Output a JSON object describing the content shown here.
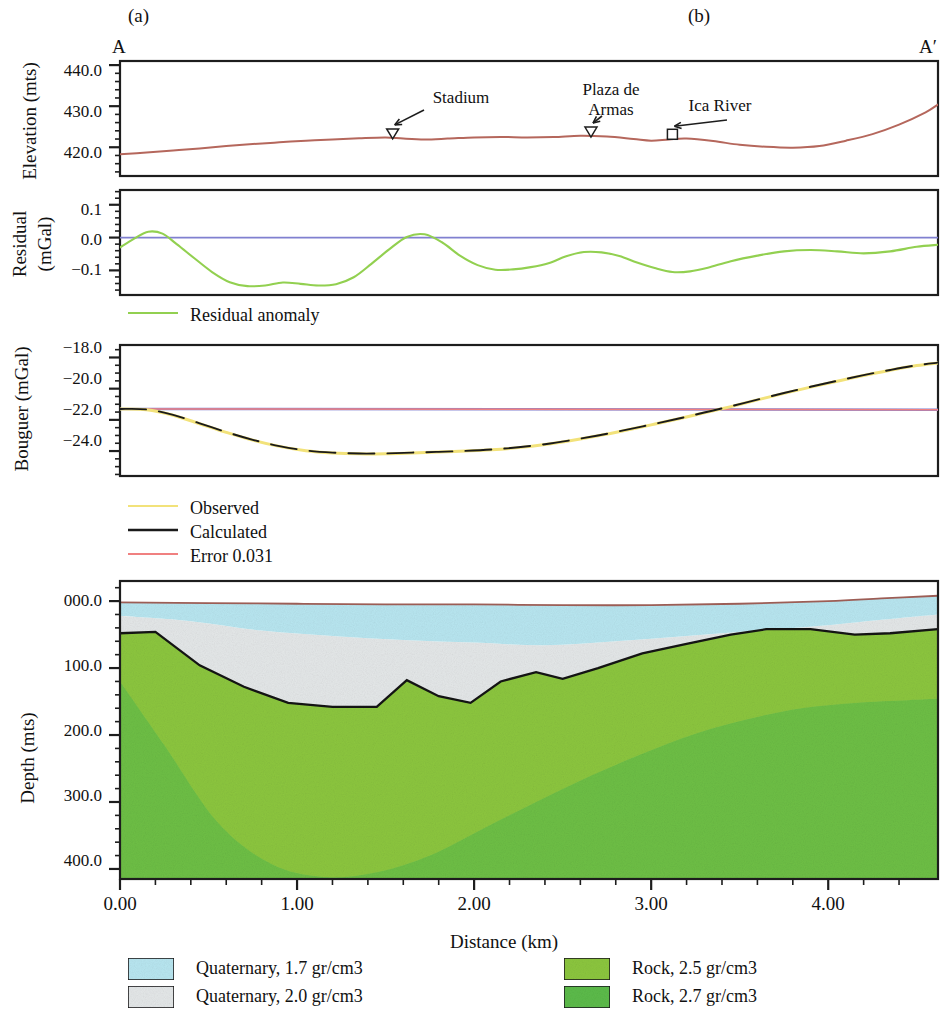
{
  "figure": {
    "subpanel_labels": [
      {
        "label": "(a)",
        "x": 140,
        "y": 16
      },
      {
        "label": "(b)",
        "x": 700,
        "y": 16
      }
    ],
    "profile_start_label": "A",
    "profile_end_label": "A′",
    "xaxis": {
      "label": "Distance (km)",
      "ticks": [
        "0.00",
        "1.00",
        "2.00",
        "3.00",
        "4.00"
      ],
      "tick_values": [
        0,
        1,
        2,
        3,
        4
      ],
      "range": [
        0,
        4.62
      ],
      "minor_step": 0.2
    }
  },
  "panels": {
    "elevation": {
      "ylabel": "Elevation (mts)",
      "ticks": [
        "440.0",
        "430.0",
        "420.0"
      ],
      "tick_values": [
        440,
        430,
        420
      ],
      "ylim": [
        413,
        441
      ],
      "annotations": [
        {
          "label": "Stadium",
          "marker": "triangle",
          "x": 1.54
        },
        {
          "label": "Plaza de\nArmas",
          "marker": "triangle",
          "x": 2.66
        },
        {
          "label": "Ica River",
          "marker": "square",
          "x": 3.12
        }
      ]
    },
    "residual": {
      "ylabel": "Residual\n(mGal)",
      "ticks": [
        "0.1",
        "0.0",
        "−0.1"
      ],
      "tick_values": [
        0.1,
        0.0,
        -0.1
      ],
      "ylim": [
        -0.175,
        0.145
      ],
      "legend": [
        {
          "label": "Residual anomaly",
          "color": "#92d050"
        }
      ]
    },
    "bouguer": {
      "ylabel": "Bouguer (mGal)",
      "ticks": [
        "−18.0",
        "−20.0",
        "−22.0",
        "−24.0"
      ],
      "tick_values": [
        -18,
        -20,
        -22,
        -24
      ],
      "ylim": [
        -25.6,
        -17.2
      ],
      "legend": [
        {
          "label": "Observed",
          "color": "#f2e27a"
        },
        {
          "label": "Calculated",
          "color": "#1a1a1a"
        },
        {
          "label": "Error 0.031",
          "color": "#f08080"
        }
      ]
    },
    "depth": {
      "ylabel": "Depth (mts)",
      "ticks": [
        "000.0",
        "100.0",
        "200.0",
        "300.0",
        "400.0"
      ],
      "tick_values": [
        0,
        100,
        200,
        300,
        400
      ],
      "ylim": [
        -30,
        415
      ],
      "legend": [
        {
          "label": "Quaternary, 1.7 gr/cm3",
          "color": "#b8e6f0"
        },
        {
          "label": "Quaternary, 2.0 gr/cm3",
          "color": "#e4e7e8"
        },
        {
          "label": "Rock, 2.5 gr/cm3",
          "color": "#8cc63f"
        },
        {
          "label": "Rock, 2.7 gr/cm3",
          "color": "#5cbb4a"
        }
      ]
    }
  },
  "chart_data": {
    "type": "line",
    "xlabel": "Distance (km)",
    "x_range": [
      0,
      4.62
    ],
    "subplots": [
      {
        "name": "elevation",
        "ylabel": "Elevation (mts)",
        "ylim": [
          413,
          441
        ],
        "series": [
          {
            "name": "Topography",
            "color": "#b5675c",
            "x": [
              0.0,
              0.15,
              0.3,
              0.45,
              0.6,
              0.75,
              0.9,
              1.05,
              1.2,
              1.35,
              1.5,
              1.6,
              1.72,
              1.85,
              2.0,
              2.15,
              2.3,
              2.45,
              2.6,
              2.75,
              2.9,
              3.0,
              3.1,
              3.2,
              3.35,
              3.5,
              3.65,
              3.8,
              3.95,
              4.1,
              4.25,
              4.4,
              4.55,
              4.62
            ],
            "y": [
              418.3,
              418.7,
              419.2,
              419.7,
              420.3,
              420.8,
              421.2,
              421.6,
              421.9,
              422.2,
              422.4,
              422.1,
              421.9,
              422.1,
              422.4,
              422.5,
              422.4,
              422.5,
              422.8,
              422.6,
              422.0,
              421.6,
              421.9,
              422.1,
              421.5,
              420.6,
              420.1,
              419.9,
              420.3,
              421.6,
              423.2,
              425.5,
              428.5,
              430.4
            ]
          }
        ]
      },
      {
        "name": "residual",
        "ylabel": "Residual (mGal)",
        "ylim": [
          -0.175,
          0.145
        ],
        "series": [
          {
            "name": "Residual anomaly",
            "color": "#92d050",
            "x": [
              0.0,
              0.08,
              0.16,
              0.24,
              0.32,
              0.42,
              0.52,
              0.62,
              0.72,
              0.82,
              0.92,
              1.02,
              1.12,
              1.22,
              1.32,
              1.42,
              1.52,
              1.62,
              1.72,
              1.82,
              1.92,
              2.02,
              2.12,
              2.22,
              2.32,
              2.42,
              2.52,
              2.62,
              2.72,
              2.82,
              2.92,
              3.02,
              3.12,
              3.22,
              3.32,
              3.45,
              3.6,
              3.75,
              3.9,
              4.05,
              4.2,
              4.35,
              4.5,
              4.62
            ],
            "y": [
              -0.03,
              -0.003,
              0.018,
              0.012,
              -0.02,
              -0.063,
              -0.105,
              -0.136,
              -0.148,
              -0.146,
              -0.137,
              -0.141,
              -0.146,
              -0.142,
              -0.121,
              -0.08,
              -0.036,
              0.002,
              0.01,
              -0.015,
              -0.055,
              -0.084,
              -0.098,
              -0.097,
              -0.09,
              -0.078,
              -0.057,
              -0.044,
              -0.045,
              -0.056,
              -0.076,
              -0.093,
              -0.105,
              -0.103,
              -0.092,
              -0.072,
              -0.055,
              -0.042,
              -0.038,
              -0.042,
              -0.048,
              -0.042,
              -0.028,
              -0.022
            ]
          },
          {
            "name": "Zero line",
            "color": "#8080d0",
            "x": [
              0,
              4.62
            ],
            "y": [
              0,
              0
            ]
          }
        ]
      },
      {
        "name": "bouguer",
        "ylabel": "Bouguer (mGal)",
        "ylim": [
          -25.6,
          -17.2
        ],
        "series": [
          {
            "name": "Observed",
            "color": "#f2e27a",
            "x": [
              0.0,
              0.15,
              0.3,
              0.45,
              0.6,
              0.75,
              0.9,
              1.05,
              1.2,
              1.35,
              1.5,
              1.65,
              1.8,
              1.95,
              2.1,
              2.25,
              2.4,
              2.55,
              2.7,
              2.85,
              3.0,
              3.15,
              3.3,
              3.45,
              3.6,
              3.75,
              3.9,
              4.05,
              4.2,
              4.35,
              4.5,
              4.62
            ],
            "y": [
              -21.3,
              -21.35,
              -21.7,
              -22.25,
              -22.8,
              -23.3,
              -23.7,
              -23.98,
              -24.12,
              -24.18,
              -24.17,
              -24.12,
              -24.06,
              -24.0,
              -23.92,
              -23.78,
              -23.58,
              -23.32,
              -23.02,
              -22.68,
              -22.32,
              -21.95,
              -21.55,
              -21.15,
              -20.72,
              -20.3,
              -19.9,
              -19.52,
              -19.15,
              -18.82,
              -18.52,
              -18.35
            ]
          },
          {
            "name": "Calculated",
            "color": "#1a1a1a",
            "x": [
              0.0,
              0.15,
              0.3,
              0.45,
              0.6,
              0.75,
              0.9,
              1.05,
              1.2,
              1.35,
              1.5,
              1.65,
              1.8,
              1.95,
              2.1,
              2.25,
              2.4,
              2.55,
              2.7,
              2.85,
              3.0,
              3.15,
              3.3,
              3.45,
              3.6,
              3.75,
              3.9,
              4.05,
              4.2,
              4.35,
              4.5,
              4.62
            ],
            "y": [
              -21.3,
              -21.33,
              -21.68,
              -22.22,
              -22.78,
              -23.28,
              -23.68,
              -23.96,
              -24.1,
              -24.16,
              -24.15,
              -24.1,
              -24.05,
              -23.99,
              -23.9,
              -23.76,
              -23.56,
              -23.3,
              -23.0,
              -22.66,
              -22.3,
              -21.93,
              -21.53,
              -21.13,
              -20.7,
              -20.28,
              -19.88,
              -19.5,
              -19.13,
              -18.8,
              -18.5,
              -18.33
            ]
          },
          {
            "name": "Error 0.031",
            "color": "#f08080",
            "x": [
              0,
              4.62
            ],
            "y": [
              -21.3,
              -21.35
            ]
          }
        ]
      },
      {
        "name": "depth_model",
        "ylabel": "Depth (mts)",
        "ylim": [
          -30,
          415
        ],
        "note": "Depth axis increases downward",
        "layers": [
          {
            "name": "Quaternary, 1.7 gr/cm3",
            "color": "#b8e6f0",
            "top_x": [
              0.0,
              0.5,
              1.0,
              1.5,
              2.0,
              2.5,
              3.0,
              3.5,
              4.0,
              4.3,
              4.62
            ],
            "top_y": [
              2,
              3,
              4,
              5,
              5,
              6,
              6,
              4,
              0,
              -4,
              -8
            ],
            "base_x": [
              0.0,
              0.4,
              0.8,
              1.2,
              1.6,
              2.0,
              2.4,
              2.8,
              3.2,
              3.6,
              4.0,
              4.3,
              4.62
            ],
            "base_y": [
              22,
              30,
              44,
              52,
              58,
              62,
              66,
              60,
              52,
              44,
              36,
              28,
              20
            ]
          },
          {
            "name": "Quaternary, 2.0 gr/cm3",
            "color": "#e4e7e8",
            "base_x": [
              0.0,
              0.2,
              0.45,
              0.7,
              0.95,
              1.2,
              1.45,
              1.62,
              1.8,
              1.98,
              2.15,
              2.35,
              2.5,
              2.7,
              2.95,
              3.2,
              3.45,
              3.65,
              3.9,
              4.15,
              4.35,
              4.62
            ],
            "base_y": [
              48,
              46,
              96,
              128,
              152,
              158,
              158,
              118,
              142,
              152,
              120,
              106,
              116,
              100,
              78,
              64,
              50,
              42,
              42,
              50,
              48,
              42
            ]
          },
          {
            "name": "Rock, 2.5 gr/cm3",
            "color": "#8cc63f"
          },
          {
            "name": "Rock, 2.7 gr/cm3",
            "color": "#5cbb4a",
            "top_x": [
              0.0,
              0.25,
              0.55,
              0.85,
              1.15,
              1.45,
              1.75,
              2.05,
              2.35,
              2.65,
              2.95,
              3.25,
              3.55,
              3.85,
              4.15,
              4.45,
              4.62
            ],
            "top_y": [
              120,
              215,
              330,
              392,
              412,
              405,
              380,
              340,
              300,
              262,
              228,
              198,
              176,
              160,
              152,
              148,
              146
            ]
          }
        ]
      }
    ]
  }
}
